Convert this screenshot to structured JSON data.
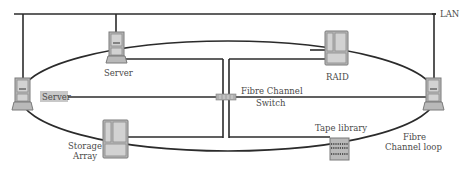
{
  "diagram": {
    "labels": {
      "lan": "LAN",
      "server_top": "Server",
      "server_left": "Server",
      "raid": "RAID",
      "switch_line1": "Fibre Channel",
      "switch_line2": "Switch",
      "storage_line1": "Storage",
      "storage_line2": "Array",
      "tape": "Tape library",
      "loop_line1": "Fibre",
      "loop_line2": "Channel loop"
    },
    "colors": {
      "line": "#2b2b2b",
      "device": "#b9b9b9",
      "device_border": "#7a7a7a",
      "label_text": "#4a4a4a",
      "label_bg": "#c8c8c8"
    },
    "nodes": [
      "Server (top)",
      "Server (left)",
      "Server (right)",
      "RAID",
      "Fibre Channel Switch",
      "Storage Array",
      "Tape library"
    ],
    "edges": [
      [
        "LAN",
        "Server (top)"
      ],
      [
        "LAN",
        "Server (left)"
      ],
      [
        "LAN",
        "Server (right)"
      ],
      [
        "Server (top)",
        "Fibre Channel Switch"
      ],
      [
        "RAID",
        "Fibre Channel Switch"
      ],
      [
        "Server (left)",
        "Fibre Channel Switch"
      ],
      [
        "Fibre Channel Switch",
        "Server (right)"
      ],
      [
        "Storage Array",
        "Fibre Channel Switch"
      ],
      [
        "Tape library",
        "Fibre Channel Switch"
      ]
    ],
    "loop": "Fibre Channel loop connects Server (top), RAID, Server (right), Tape library, Storage Array, Server (left)"
  }
}
